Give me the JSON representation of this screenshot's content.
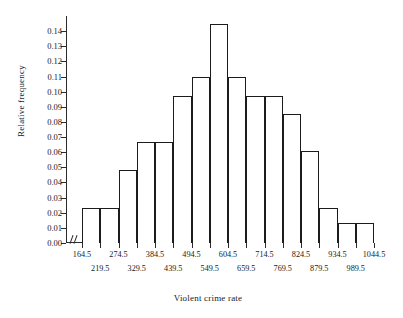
{
  "chart_data": {
    "type": "bar",
    "title": "",
    "xlabel": "Violent crime rate",
    "ylabel": "Relative frequency",
    "ylim": [
      0.0,
      0.15
    ],
    "ytick_labels": [
      "0.00",
      "0.01",
      "0.02",
      "0.03",
      "0.04",
      "0.05",
      "0.06",
      "0.07",
      "0.08",
      "0.09",
      "0.10",
      "0.11",
      "0.12",
      "0.13",
      "0.14"
    ],
    "ytick_values": [
      0.0,
      0.01,
      0.02,
      0.03,
      0.04,
      0.05,
      0.06,
      0.07,
      0.08,
      0.09,
      0.1,
      0.11,
      0.12,
      0.13,
      0.14
    ],
    "xlim": [
      164.5,
      1044.5
    ],
    "bin_width": 55,
    "bin_edges": [
      164.5,
      219.5,
      274.5,
      329.5,
      384.5,
      439.5,
      494.5,
      549.5,
      604.5,
      659.5,
      714.5,
      769.5,
      824.5,
      879.5,
      934.5,
      989.5,
      1044.5
    ],
    "xtick_labels": [
      "164.5",
      "219.5",
      "274.5",
      "329.5",
      "384.5",
      "439.5",
      "494.5",
      "549.5",
      "604.5",
      "659.5",
      "714.5",
      "769.5",
      "824.5",
      "879.5",
      "934.5",
      "989.5",
      "1044.5"
    ],
    "xtick_rows": [
      0,
      1,
      0,
      1,
      0,
      1,
      0,
      1,
      0,
      1,
      0,
      1,
      0,
      1,
      0,
      1,
      0
    ],
    "categories": [
      "164.5-219.5",
      "219.5-274.5",
      "274.5-329.5",
      "329.5-384.5",
      "384.5-439.5",
      "439.5-494.5",
      "494.5-549.5",
      "549.5-604.5",
      "604.5-659.5",
      "659.5-714.5",
      "714.5-769.5",
      "769.5-824.5",
      "824.5-879.5",
      "879.5-934.5",
      "934.5-989.5",
      "989.5-1044.5"
    ],
    "values": [
      0.023,
      0.023,
      0.048,
      0.067,
      0.067,
      0.097,
      0.11,
      0.145,
      0.11,
      0.097,
      0.097,
      0.085,
      0.061,
      0.023,
      0.013,
      0.013
    ],
    "grid": false,
    "legend": null,
    "axis_break": "//",
    "bar_fill": "#ffffff",
    "bar_edge": "#1c1c1c",
    "axis_color": "#2b2b2b"
  }
}
